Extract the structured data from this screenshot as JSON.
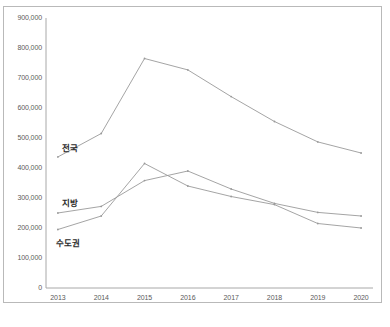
{
  "chart_data": {
    "type": "line",
    "title": "",
    "xlabel": "",
    "ylabel": "",
    "categories": [
      "2013",
      "2014",
      "2015",
      "2016",
      "2017",
      "2018",
      "2019",
      "2020"
    ],
    "x": [
      2013,
      2014,
      2015,
      2016,
      2017,
      2018,
      2019,
      2020
    ],
    "ylim": [
      0,
      900000
    ],
    "yticks": [
      0,
      100000,
      200000,
      300000,
      400000,
      500000,
      600000,
      700000,
      800000,
      900000
    ],
    "ytick_labels": [
      "0",
      "100,000",
      "200,000",
      "300,000",
      "400,000",
      "500,000",
      "600,000",
      "700,000",
      "800,000",
      "900,000"
    ],
    "grid": false,
    "legend_position": "inline-labels",
    "series": [
      {
        "name": "전국",
        "label": "전국",
        "color": "#9a9a9a",
        "values": [
          437000,
          515000,
          765000,
          727000,
          638000,
          555000,
          487000,
          450000
        ]
      },
      {
        "name": "지방",
        "label": "지방",
        "color": "#9a9a9a",
        "values": [
          250000,
          272000,
          358000,
          390000,
          330000,
          282000,
          252000,
          240000
        ]
      },
      {
        "name": "수도권",
        "label": "수도권",
        "color": "#9a9a9a",
        "values": [
          195000,
          240000,
          415000,
          340000,
          305000,
          278000,
          215000,
          200000
        ]
      }
    ]
  },
  "labels": {
    "series_jeonguk": "전국",
    "series_jibang": "지방",
    "series_sudogwon": "수도권"
  },
  "caption": {
    "text": ""
  },
  "colors": {
    "line": "#9a9a9a",
    "axis": "#a8a8a8",
    "frame": "#b9b9b9",
    "tick_text": "#5a5a5a",
    "label_text": "#2b2b2b",
    "background": "#ffffff"
  }
}
